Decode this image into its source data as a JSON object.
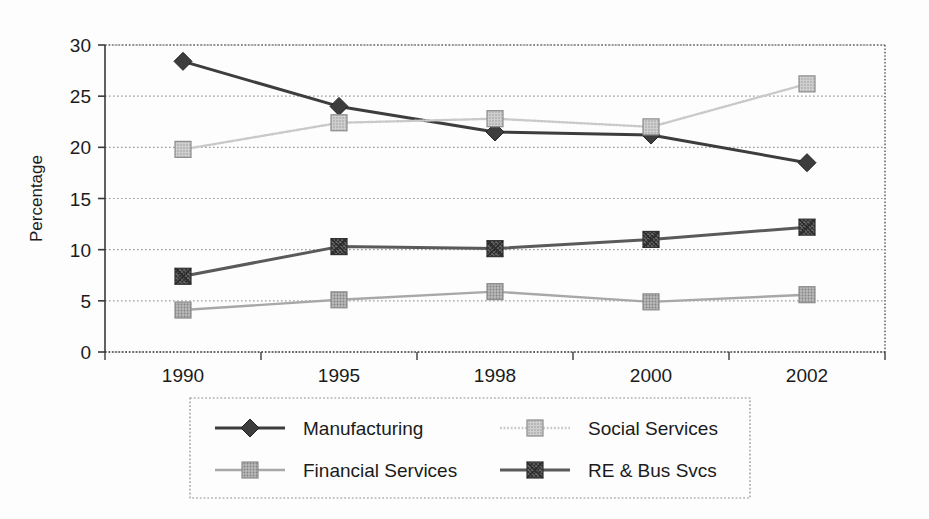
{
  "chart_data": {
    "type": "line",
    "title": "",
    "xlabel": "",
    "ylabel": "Percentage",
    "categories": [
      "1990",
      "1995",
      "1998",
      "2000",
      "2002"
    ],
    "ylim": [
      0,
      30
    ],
    "yticks": [
      "0",
      "5",
      "10",
      "15",
      "20",
      "25",
      "30"
    ],
    "grid": true,
    "legend_position": "bottom",
    "series": [
      {
        "name": "Manufacturing",
        "marker": "diamond",
        "color": "#3d3d3d",
        "values": [
          28.4,
          24.0,
          21.5,
          21.2,
          18.5
        ]
      },
      {
        "name": "Social Services",
        "marker": "square",
        "color": "#c9c9c9",
        "values": [
          19.8,
          22.4,
          22.8,
          22.0,
          26.2
        ]
      },
      {
        "name": "Financial Services",
        "marker": "square",
        "color": "#a8a8a8",
        "values": [
          4.1,
          5.1,
          5.9,
          4.9,
          5.6
        ]
      },
      {
        "name": "RE & Bus Svcs",
        "marker": "square-x",
        "color": "#5a5a5a",
        "values": [
          7.4,
          10.3,
          10.1,
          11.0,
          12.2
        ]
      }
    ]
  },
  "legend": {
    "entries": [
      {
        "label": "Manufacturing"
      },
      {
        "label": "Social Services"
      },
      {
        "label": "Financial Services"
      },
      {
        "label": "RE & Bus Svcs"
      }
    ]
  },
  "colors": {
    "axis": "#3a3a3a",
    "grid": "#9a9a9a",
    "background": "#fdfdfd",
    "manufacturing": "#3d3d3d",
    "social_services": "#c9c9c9",
    "financial_services": "#a8a8a8",
    "re_bus_svcs": "#5a5a5a"
  }
}
